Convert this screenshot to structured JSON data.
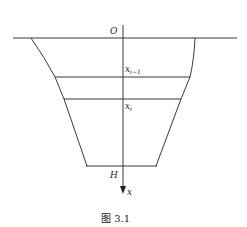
{
  "figure": {
    "caption": "图 3.1",
    "labels": {
      "origin": "O",
      "x_prev_base": "x",
      "x_prev_sub": "i−1",
      "x_curr_base": "x",
      "x_curr_sub": "i",
      "depth": "H",
      "axis": "x"
    },
    "colors": {
      "stroke": "#222222",
      "background": "#ffffff"
    }
  }
}
